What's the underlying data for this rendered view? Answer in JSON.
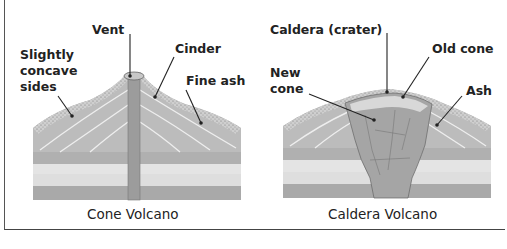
{
  "cone_volcano": {
    "caption": "Cone Volcano",
    "labels": {
      "vent": "Vent",
      "cinder": "Cinder",
      "sides": "Slightly\nconcave\nsides",
      "fine_ash": "Fine ash"
    }
  },
  "caldera_volcano": {
    "caption": "Caldera Volcano",
    "labels": {
      "caldera": "Caldera (crater)",
      "old_cone": "Old cone",
      "new_cone": "New\ncone",
      "ash": "Ash"
    }
  },
  "colors": {
    "layer_dark": "#a8a8a8",
    "layer_mid": "#bdbdbd",
    "layer_light": "#e2e2e2",
    "vent": "#9a9a9a",
    "text": "#222222"
  }
}
